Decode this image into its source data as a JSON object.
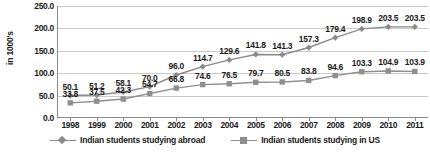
{
  "chart_data": {
    "type": "line",
    "title": "",
    "xlabel": "",
    "ylabel": "in 1000's",
    "ylim": [
      0,
      250
    ],
    "ytick_values": [
      0,
      50,
      100,
      150,
      200,
      250
    ],
    "ytick_labels": [
      "0.0",
      "50.0",
      "100.0",
      "150.0",
      "200.0",
      "250.0"
    ],
    "grid": true,
    "legend_position": "bottom",
    "categories": [
      "1998",
      "1999",
      "2000",
      "2001",
      "2002",
      "2003",
      "2004",
      "2005",
      "2006",
      "2007",
      "2008",
      "2009",
      "2010",
      "2011"
    ],
    "series": [
      {
        "name": "Indian students studying abroad",
        "marker": "diamond",
        "color": "#8a8a8a",
        "values": [
          50.1,
          51.2,
          58.1,
          70.0,
          96.0,
          114.7,
          129.6,
          141.8,
          141.3,
          157.3,
          179.4,
          198.9,
          203.5,
          203.5
        ],
        "labels": [
          "50.1",
          "51.2",
          "58.1",
          "70.0",
          "96.0",
          "114.7",
          "129.6",
          "141.8",
          "141.3",
          "157.3",
          "179.4",
          "198.9",
          "203.5",
          "203.5"
        ]
      },
      {
        "name": "Indian students studying in US",
        "marker": "square",
        "color": "#8f8f8f",
        "values": [
          33.8,
          37.5,
          42.3,
          54.7,
          66.8,
          74.6,
          76.5,
          79.7,
          80.5,
          83.8,
          94.6,
          103.3,
          104.9,
          103.9
        ],
        "labels": [
          "33.8",
          "37.5",
          "42.3",
          "54.7",
          "66.8",
          "74.6",
          "76.5",
          "79.7",
          "80.5",
          "83.8",
          "94.6",
          "103.3",
          "104.9",
          "103.9"
        ]
      }
    ]
  }
}
